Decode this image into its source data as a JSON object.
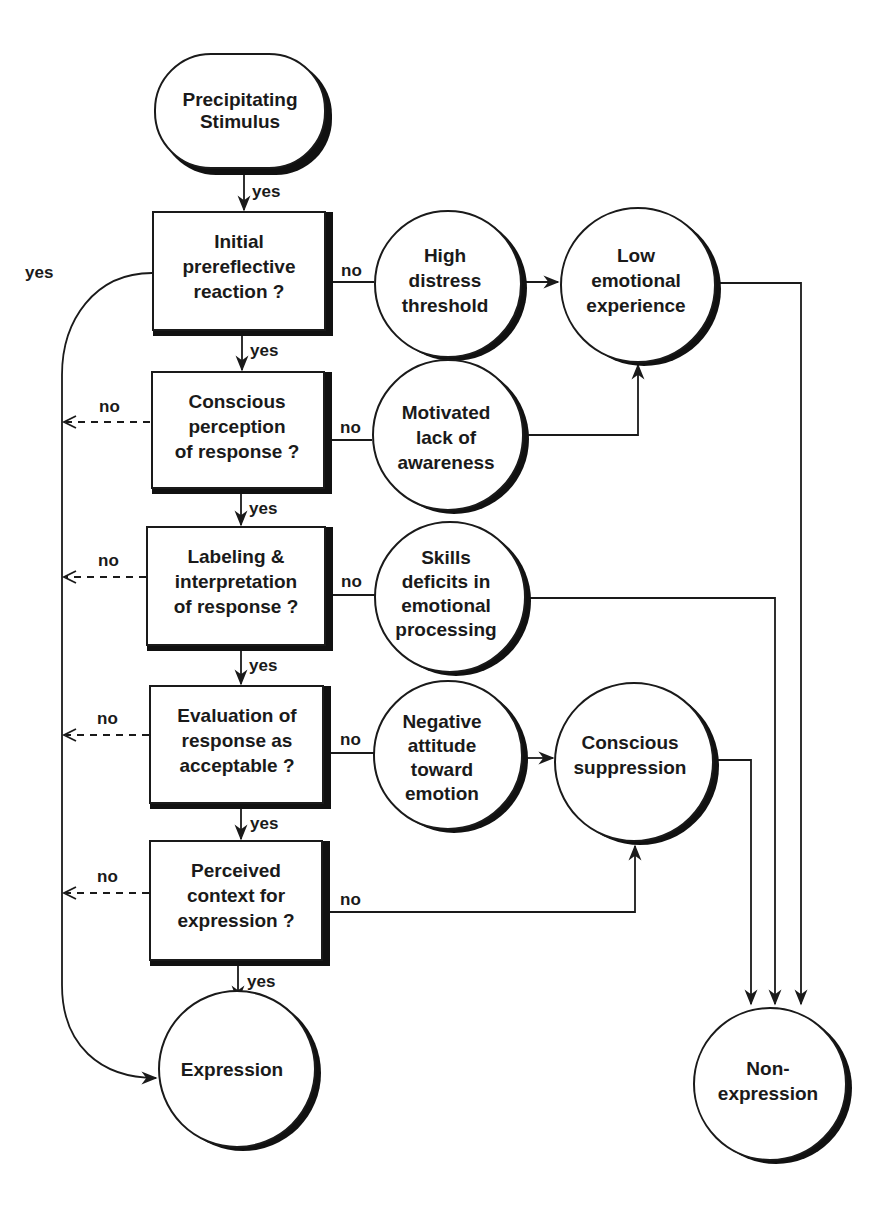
{
  "diagram": {
    "title": "",
    "nodes": {
      "start": {
        "lines": [
          "Precipitating",
          "Stimulus"
        ]
      },
      "q1": {
        "lines": [
          "Initial",
          "prereflective",
          "reaction ?"
        ]
      },
      "q2": {
        "lines": [
          "Conscious",
          "perception",
          "of response ?"
        ]
      },
      "q3": {
        "lines": [
          "Labeling &",
          "interpretation",
          "of response ?"
        ]
      },
      "q4": {
        "lines": [
          "Evaluation of",
          "response as",
          "acceptable ?"
        ]
      },
      "q5": {
        "lines": [
          "Perceived",
          "context for",
          "expression ?"
        ]
      },
      "c_high_distress": {
        "lines": [
          "High",
          "distress",
          "threshold"
        ]
      },
      "c_low_emotional": {
        "lines": [
          "Low",
          "emotional",
          "experience"
        ]
      },
      "c_motivated": {
        "lines": [
          "Motivated",
          "lack of",
          "awareness"
        ]
      },
      "c_skills": {
        "lines": [
          "Skills",
          "deficits in",
          "emotional",
          "processing"
        ]
      },
      "c_negative": {
        "lines": [
          "Negative",
          "attitude",
          "toward",
          "emotion"
        ]
      },
      "c_suppression": {
        "lines": [
          "Conscious",
          "suppression"
        ]
      },
      "expression": {
        "lines": [
          "Expression"
        ]
      },
      "non_expression": {
        "lines": [
          "Non-",
          "expression"
        ]
      }
    },
    "edge_labels": {
      "yes": "yes",
      "no": "no"
    },
    "edges": [
      {
        "from": "start",
        "to": "q1",
        "label": "yes"
      },
      {
        "from": "q1",
        "to": "q2",
        "label": "yes"
      },
      {
        "from": "q2",
        "to": "q3",
        "label": "yes"
      },
      {
        "from": "q3",
        "to": "q4",
        "label": "yes"
      },
      {
        "from": "q4",
        "to": "q5",
        "label": "yes"
      },
      {
        "from": "q5",
        "to": "expression",
        "label": "yes"
      },
      {
        "from": "q1",
        "to": "expression",
        "label": "yes",
        "style": "curved-left"
      },
      {
        "from": "q1",
        "to": "c_high_distress",
        "label": "no"
      },
      {
        "from": "c_high_distress",
        "to": "c_low_emotional",
        "label": ""
      },
      {
        "from": "q2",
        "to": "c_motivated",
        "label": "no"
      },
      {
        "from": "c_motivated",
        "to": "c_low_emotional",
        "label": ""
      },
      {
        "from": "q3",
        "to": "c_skills",
        "label": "no"
      },
      {
        "from": "q4",
        "to": "c_negative",
        "label": "no"
      },
      {
        "from": "c_negative",
        "to": "c_suppression",
        "label": ""
      },
      {
        "from": "q5",
        "to": "c_suppression",
        "label": "no"
      },
      {
        "from": "q2",
        "to": "expression",
        "label": "no",
        "style": "dashed"
      },
      {
        "from": "q3",
        "to": "expression",
        "label": "no",
        "style": "dashed"
      },
      {
        "from": "q4",
        "to": "expression",
        "label": "no",
        "style": "dashed"
      },
      {
        "from": "q5",
        "to": "expression",
        "label": "no",
        "style": "dashed"
      },
      {
        "from": "c_low_emotional",
        "to": "non_expression",
        "label": ""
      },
      {
        "from": "c_skills",
        "to": "non_expression",
        "label": ""
      },
      {
        "from": "c_suppression",
        "to": "non_expression",
        "label": ""
      }
    ]
  }
}
